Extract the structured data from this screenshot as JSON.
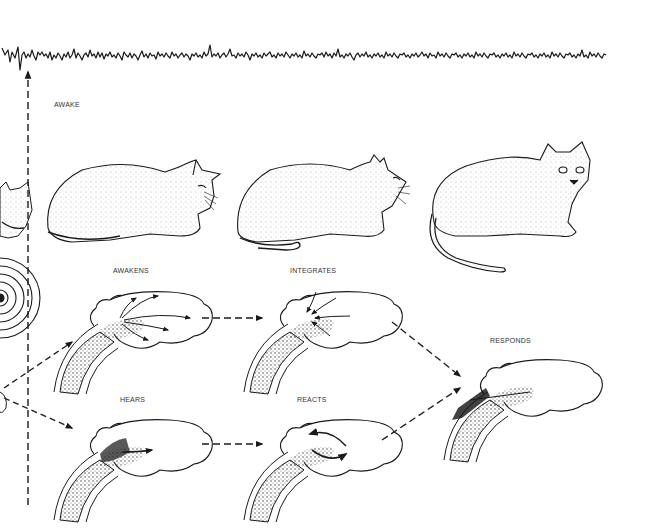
{
  "figure": {
    "eeg_trace": {
      "label": "EEG trace",
      "state_label": "AWAKE"
    },
    "cats": [
      {
        "id": "cat-resting",
        "description": "cat lying down, eyes half closed"
      },
      {
        "id": "cat-alert",
        "description": "cat lying down, head raised, alert"
      },
      {
        "id": "cat-looking",
        "description": "cat crouched, looking toward viewer"
      }
    ],
    "stages": {
      "awakens": "AWAKENS",
      "integrates": "INTEGRATES",
      "responds": "RESPONDS",
      "hears": "HEARS",
      "reacts": "REACTS"
    },
    "colors": {
      "ink": "#1a1a1a",
      "background": "#ffffff",
      "label": "#333333"
    }
  }
}
